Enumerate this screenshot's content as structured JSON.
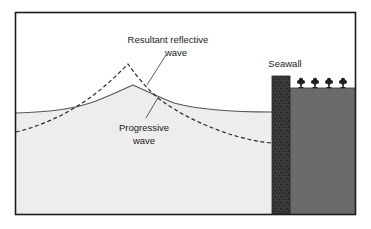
{
  "figure": {
    "frame": {
      "border_color": "#1d1d1d",
      "background_color": "#ffffff",
      "x": 15,
      "y": 12,
      "width": 341,
      "height": 203
    }
  },
  "labels": {
    "resultant": {
      "line1": "Resultant reflective",
      "line2": "wave"
    },
    "progressive": {
      "line1": "Progressive",
      "line2": "wave"
    },
    "seawall": "Seawall"
  },
  "colors": {
    "water_fill": "#ededed",
    "water_line": "#555555",
    "dashed_wave": "#2a2a2a",
    "land_fill": "#6a6a6a",
    "seawall_fill": "#3d3d3d",
    "seawall_speckle": "#222222",
    "shrub": "#1e1e1e",
    "leader_line": "#4a4a4a",
    "text": "#1a1a1a",
    "sky": "#ffffff"
  },
  "geometry": {
    "waterline_left_y": 113,
    "waterline_right_y": 112,
    "progressive_peak": {
      "x": 133,
      "y": 85
    },
    "resultant_peak": {
      "x": 128,
      "y": 64
    },
    "dashed_left_y": 132,
    "dashed_right_y": 142,
    "land_top_y": 88,
    "seawall": {
      "x": 272,
      "y": 76,
      "width": 18,
      "height": 139
    },
    "shrub_count": 4,
    "shrub_positions": [
      301,
      315,
      329,
      343
    ]
  },
  "elements": {
    "water_body_name": "progressive-wave-water-body",
    "land_mass_name": "land-mass",
    "seawall_name": "seawall-structure"
  }
}
